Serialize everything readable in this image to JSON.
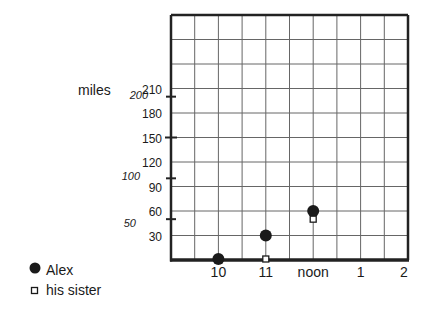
{
  "chart_data": {
    "type": "scatter",
    "title": "",
    "ylabel": "miles",
    "xlabel": "",
    "x_categories": [
      "9",
      "10",
      "11",
      "noon",
      "1",
      "2"
    ],
    "x_tick_labels": [
      "10",
      "11",
      "noon",
      "1",
      "2"
    ],
    "y_grid_labels": [
      30,
      60,
      90,
      120,
      150,
      180,
      210
    ],
    "y_italic_ticks": [
      50,
      100,
      200
    ],
    "ylim": [
      0,
      300
    ],
    "grid": true,
    "legend_position": "bottom-left",
    "series": [
      {
        "name": "Alex",
        "marker": "filled-circle",
        "points": [
          {
            "x": "10",
            "y": 0
          },
          {
            "x": "11",
            "y": 30
          },
          {
            "x": "noon",
            "y": 60
          }
        ]
      },
      {
        "name": "his sister",
        "marker": "open-square",
        "points": [
          {
            "x": "11",
            "y": 0
          },
          {
            "x": "noon",
            "y": 50
          }
        ]
      }
    ]
  },
  "legend": [
    {
      "label": "Alex",
      "marker": "filled-circle"
    },
    {
      "label": "his sister",
      "marker": "open-square"
    }
  ],
  "axis": {
    "y_title": "miles"
  },
  "colors": {
    "ink": "#1a1a1a",
    "grid": "#555555",
    "background": "#ffffff"
  }
}
